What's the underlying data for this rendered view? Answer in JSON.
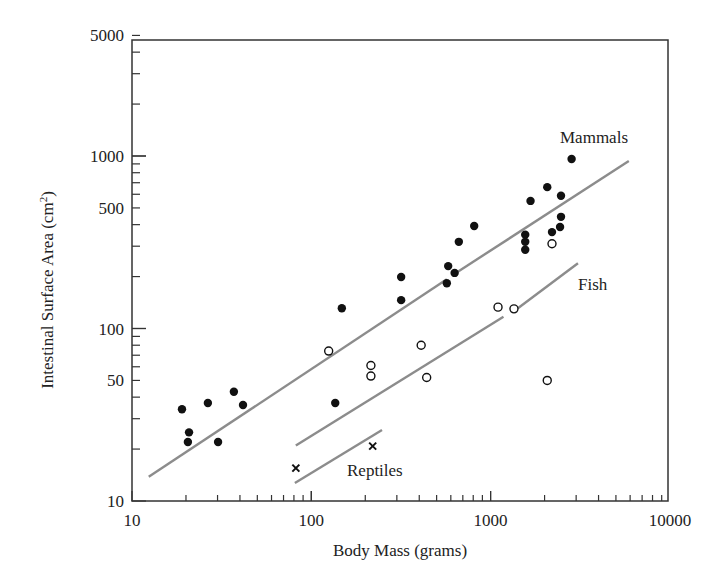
{
  "chart_data": {
    "type": "scatter",
    "title": "",
    "xlabel": "Body Mass (grams)",
    "ylabel": "Intestinal Surface Area (cm²)",
    "xscale": "log",
    "yscale": "log",
    "xlim": [
      10,
      10000
    ],
    "ylim": [
      10,
      5000
    ],
    "x_ticks": [
      10,
      100,
      1000,
      10000
    ],
    "x_tick_labels": [
      "10",
      "100",
      "1000",
      "10000"
    ],
    "y_ticks": [
      10,
      50,
      100,
      500,
      1000,
      5000
    ],
    "y_tick_labels": [
      "10",
      "50",
      "100",
      "500",
      "1000",
      "5000"
    ],
    "grid": false,
    "legend": "inline labels",
    "series": [
      {
        "name": "Mammals",
        "marker": "filled-circle",
        "points": [
          [
            19.0,
            34
          ],
          [
            20.8,
            25
          ],
          [
            20.5,
            22
          ],
          [
            26.5,
            37
          ],
          [
            30.2,
            22
          ],
          [
            37,
            43
          ],
          [
            41.6,
            36
          ],
          [
            136,
            37
          ],
          [
            148,
            131
          ],
          [
            317,
            199
          ],
          [
            317,
            146
          ],
          [
            580,
            230
          ],
          [
            630,
            210
          ],
          [
            570,
            183
          ],
          [
            665,
            318
          ],
          [
            810,
            393
          ],
          [
            1560,
            350
          ],
          [
            1560,
            318
          ],
          [
            1560,
            286
          ],
          [
            1670,
            549
          ],
          [
            2070,
            660
          ],
          [
            2470,
            588
          ],
          [
            2470,
            444
          ],
          [
            2440,
            388
          ],
          [
            2200,
            362
          ],
          [
            2830,
            960
          ]
        ],
        "fit_line": {
          "segments": [
            [
              [
                12.4,
                13.8
              ],
              [
                570,
                193
              ]
            ],
            [
              [
                650,
                212
              ],
              [
                5900,
                934
              ]
            ]
          ]
        },
        "label_pos": [
          1700,
          1300
        ]
      },
      {
        "name": "Fish",
        "marker": "open-circle",
        "points": [
          [
            125,
            74
          ],
          [
            215,
            61
          ],
          [
            215,
            53
          ],
          [
            410,
            80
          ],
          [
            440,
            52
          ],
          [
            1100,
            133
          ],
          [
            1350,
            130
          ],
          [
            2200,
            310
          ],
          [
            2070,
            50
          ]
        ],
        "fit_line": {
          "segments": [
            [
              [
                82,
                21
              ],
              [
                1180,
                117
              ]
            ],
            [
              [
                1420,
                131
              ],
              [
                3070,
                239
              ]
            ]
          ]
        },
        "label_pos": [
          3100,
          150
        ]
      },
      {
        "name": "Reptiles",
        "marker": "x",
        "points": [
          [
            82,
            15.5
          ],
          [
            220,
            20.8
          ]
        ],
        "fit_line": {
          "segments": [
            [
              [
                81,
                12.7
              ],
              [
                248,
                25.8
              ]
            ]
          ]
        },
        "label_pos": [
          120,
          16
        ]
      }
    ]
  },
  "labels": {
    "mammals": "Mammals",
    "fish": "Fish",
    "reptiles": "Reptiles",
    "xlabel": "Body Mass (grams)",
    "ylabel_main": "Intestinal Surface Area (cm",
    "ylabel_sup": "2",
    "ylabel_end": ")"
  },
  "colors": {
    "axis": "#333333",
    "fit_line": "#8c8c8c",
    "marker": "#111111"
  }
}
